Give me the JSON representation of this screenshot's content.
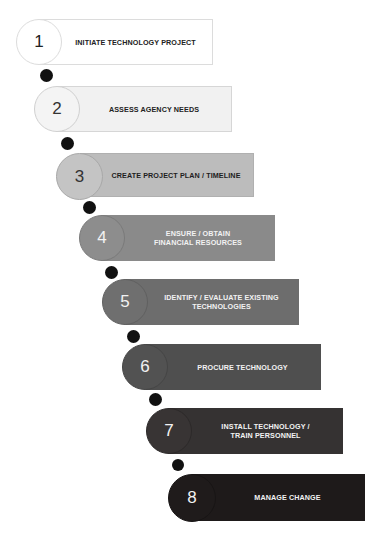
{
  "diagram": {
    "type": "process-steps",
    "steps": [
      {
        "number": "1",
        "label_line1": "INITIATE TECHNOLOGY PROJECT",
        "label_line2": "",
        "bar_color": "#ffffff",
        "circle_color": "#ffffff",
        "border_color": "#dcdcdc",
        "text_color": "#222222",
        "number_color": "#222222"
      },
      {
        "number": "2",
        "label_line1": "ASSESS AGENCY NEEDS",
        "label_line2": "",
        "bar_color": "#f1f1f1",
        "circle_color": "#f4f4f4",
        "border_color": "#d6d6d6",
        "text_color": "#222222",
        "number_color": "#333333"
      },
      {
        "number": "3",
        "label_line1": "CREATE PROJECT PLAN / TIMELINE",
        "label_line2": "",
        "bar_color": "#bcbcbc",
        "circle_color": "#c4c4c4",
        "border_color": "#b0b0b0",
        "text_color": "#1e1e1e",
        "number_color": "#333333"
      },
      {
        "number": "4",
        "label_line1": "ENSURE / OBTAIN",
        "label_line2": "FINANCIAL RESOURCES",
        "bar_color": "#8a8a8a",
        "circle_color": "#8d8d8d",
        "border_color": "#7e7e7e",
        "text_color": "#f2f2f2",
        "number_color": "#f2f2f2"
      },
      {
        "number": "5",
        "label_line1": "IDENTIFY / EVALUATE EXISTING",
        "label_line2": "TECHNOLOGIES",
        "bar_color": "#6d6d6d",
        "circle_color": "#6f6f6f",
        "border_color": "#626262",
        "text_color": "#f2f2f2",
        "number_color": "#f2f2f2"
      },
      {
        "number": "6",
        "label_line1": "PROCURE TECHNOLOGY",
        "label_line2": "",
        "bar_color": "#4f4f4f",
        "circle_color": "#525252",
        "border_color": "#464646",
        "text_color": "#f2f2f2",
        "number_color": "#f2f2f2"
      },
      {
        "number": "7",
        "label_line1": "INSTALL TECHNOLOGY /",
        "label_line2": "TRAIN PERSONNEL",
        "bar_color": "#353232",
        "circle_color": "#383434",
        "border_color": "#2e2b2b",
        "text_color": "#f2f2f2",
        "number_color": "#f2f2f2"
      },
      {
        "number": "8",
        "label_line1": "MANAGE CHANGE",
        "label_line2": "",
        "bar_color": "#1e1a1a",
        "circle_color": "#1f1b1b",
        "border_color": "#191616",
        "text_color": "#f2f2f2",
        "number_color": "#f2f2f2"
      }
    ],
    "connector_color": "#111111"
  }
}
